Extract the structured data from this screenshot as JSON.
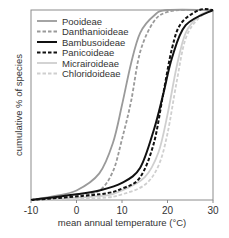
{
  "chart_data": {
    "type": "line",
    "title": "",
    "xlabel": "mean annual temperature (°C)",
    "ylabel": "cumulative % of species",
    "xlim": [
      -10,
      30
    ],
    "ylim": [
      0,
      100
    ],
    "xticks": [
      -10,
      0,
      10,
      20,
      30
    ],
    "xtick_labels": [
      "-10",
      "0",
      "10",
      "20",
      "30"
    ],
    "yticks": [],
    "grid": false,
    "legend_position": "upper left",
    "series": [
      {
        "name": "Pooideae",
        "color": "#9a9a9a",
        "style": "solid",
        "width": 1.8,
        "x": [
          -10,
          -5,
          0,
          5,
          8,
          10,
          12,
          14,
          17,
          20,
          30
        ],
        "y": [
          0,
          2,
          5,
          14,
          30,
          50,
          72,
          88,
          97,
          100,
          100
        ]
      },
      {
        "name": "Danthanioideae",
        "color": "#9a9a9a",
        "style": "dashed",
        "width": 1.8,
        "x": [
          -10,
          0,
          5,
          8,
          10,
          12,
          14,
          17,
          20,
          24,
          30
        ],
        "y": [
          0,
          2,
          5,
          15,
          32,
          52,
          78,
          94,
          99,
          100,
          100
        ]
      },
      {
        "name": "Bambusoideae",
        "color": "#111111",
        "style": "solid",
        "width": 2.0,
        "x": [
          -10,
          0,
          5,
          10,
          14,
          17,
          19,
          21,
          24,
          30
        ],
        "y": [
          0,
          3,
          5,
          9,
          17,
          37,
          55,
          75,
          92,
          100
        ]
      },
      {
        "name": "Panicoideae",
        "color": "#111111",
        "style": "dashed",
        "width": 2.0,
        "x": [
          -10,
          5,
          10,
          14,
          17,
          19,
          21,
          23,
          27,
          30
        ],
        "y": [
          0,
          3,
          6,
          12,
          30,
          55,
          80,
          93,
          100,
          100
        ]
      },
      {
        "name": "Micrairoideae",
        "color": "#cfcfcf",
        "style": "solid",
        "width": 1.8,
        "x": [
          -10,
          5,
          10,
          15,
          18,
          20,
          22,
          24,
          27,
          30
        ],
        "y": [
          0,
          2,
          5,
          12,
          25,
          45,
          70,
          88,
          97,
          100
        ]
      },
      {
        "name": "Chloridoideae",
        "color": "#cfcfcf",
        "style": "dashed",
        "width": 1.8,
        "x": [
          -10,
          5,
          10,
          15,
          18,
          20,
          22,
          24,
          27,
          30
        ],
        "y": [
          0,
          1,
          3,
          8,
          18,
          35,
          62,
          85,
          96,
          100
        ]
      }
    ]
  },
  "layout": {
    "plot_left": 31,
    "plot_right": 213,
    "plot_top": 10,
    "plot_bottom": 200
  }
}
